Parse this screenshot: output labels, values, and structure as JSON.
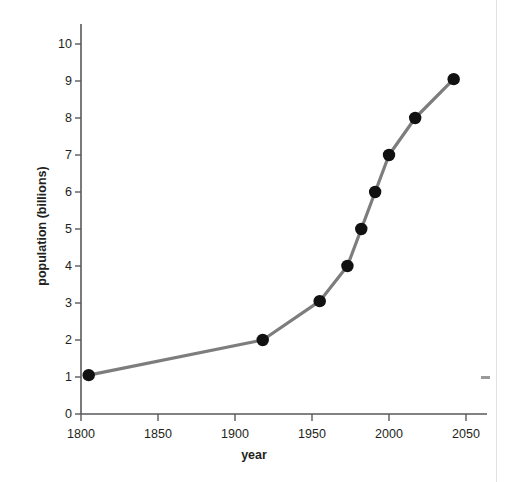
{
  "chart_data": {
    "type": "line",
    "title": "",
    "xlabel": "year",
    "ylabel": "population (billions)",
    "xlim": [
      1800,
      2055
    ],
    "ylim": [
      0,
      10.4
    ],
    "xticks": [
      1800,
      1850,
      1900,
      1950,
      2000,
      2050
    ],
    "xtick_labels": [
      "1800",
      "1850",
      "1900",
      "1950",
      "2000",
      "2050"
    ],
    "yticks": [
      0,
      1,
      2,
      3,
      4,
      5,
      6,
      7,
      8,
      9,
      10
    ],
    "ytick_labels": [
      "0",
      "1",
      "2",
      "3",
      "4",
      "5",
      "6",
      "7",
      "8",
      "9",
      "10"
    ],
    "grid": false,
    "legend": false,
    "legend_position": "none",
    "line_color": "#7d7d7d",
    "marker_color": "#111111",
    "axis_color": "#58595b",
    "series": [
      {
        "name": "world population",
        "x": [
          1805,
          1918,
          1955,
          1973,
          1982,
          1991,
          2000,
          2017,
          2042
        ],
        "y": [
          1.05,
          2.0,
          3.05,
          4.0,
          5.0,
          6.0,
          7.0,
          8.0,
          9.05
        ]
      }
    ]
  }
}
